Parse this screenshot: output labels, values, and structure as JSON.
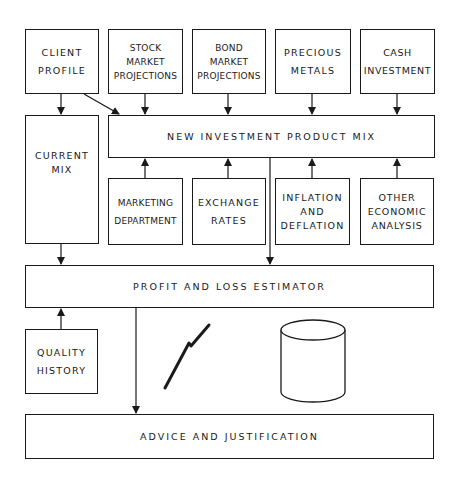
{
  "diagram": {
    "type": "flow-block-diagram",
    "boxes": {
      "client_profile": "CLIENT\nPROFILE",
      "stock_market_projections": "STOCK\nMARKET\nPROJECTIONS",
      "bond_market_projections": "BOND\nMARKET\nPROJECTIONS",
      "precious_metals": "PRECIOUS\nMETALS",
      "cash_investment": "CASH\nINVESTMENT",
      "new_investment_product_mix": "NEW INVESTMENT PRODUCT MIX",
      "current_mix": "CURRENT\nMIX",
      "marketing_department": "MARKETING\nDEPARTMENT",
      "exchange_rates": "EXCHANGE\nRATES",
      "inflation_and_deflation": "INFLATION\nAND\nDEFLATION",
      "other_economic_analysis": "OTHER\nECONOMIC\nANALYSIS",
      "profit_and_loss_estimator": "PROFIT AND LOSS ESTIMATOR",
      "quality_history": "QUALITY\nHISTORY",
      "advice_and_justification": "ADVICE AND JUSTIFICATION"
    },
    "icons": {
      "communication_link": "lightning-bolt-icon",
      "database": "database-cylinder-icon"
    },
    "edges": [
      {
        "from": "client_profile",
        "to": "current_mix"
      },
      {
        "from": "client_profile",
        "to": "new_investment_product_mix"
      },
      {
        "from": "stock_market_projections",
        "to": "new_investment_product_mix"
      },
      {
        "from": "bond_market_projections",
        "to": "new_investment_product_mix"
      },
      {
        "from": "precious_metals",
        "to": "new_investment_product_mix"
      },
      {
        "from": "cash_investment",
        "to": "new_investment_product_mix"
      },
      {
        "from": "marketing_department",
        "to": "new_investment_product_mix"
      },
      {
        "from": "exchange_rates",
        "to": "new_investment_product_mix"
      },
      {
        "from": "inflation_and_deflation",
        "to": "new_investment_product_mix"
      },
      {
        "from": "other_economic_analysis",
        "to": "new_investment_product_mix"
      },
      {
        "from": "current_mix",
        "to": "profit_and_loss_estimator"
      },
      {
        "from": "new_investment_product_mix",
        "to": "profit_and_loss_estimator"
      },
      {
        "from": "quality_history",
        "to": "profit_and_loss_estimator"
      },
      {
        "from": "profit_and_loss_estimator",
        "to": "advice_and_justification"
      }
    ],
    "colors": {
      "line": "#1a1a1a",
      "background": "#ffffff"
    }
  }
}
